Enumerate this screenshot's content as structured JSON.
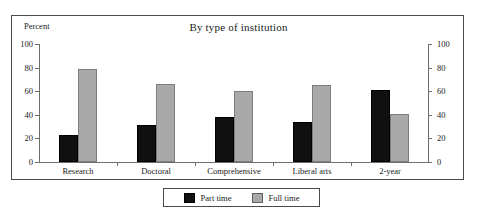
{
  "chart_data": {
    "type": "bar",
    "title": "By type of institution",
    "xlabel": "",
    "ylabel": "Percent",
    "ylim": [
      0,
      100
    ],
    "yticks": [
      0,
      20,
      40,
      60,
      80,
      100
    ],
    "ytick_labels": [
      "0",
      "20",
      "40",
      "60",
      "80",
      "100"
    ],
    "grid": false,
    "dual_axis": true,
    "right_axis_labels": [
      "0",
      "20",
      "40",
      "60",
      "80",
      "100"
    ],
    "legend_position": "bottom-outside",
    "categories": [
      "Research",
      "Doctoral",
      "Comprehensive",
      "Liberal arts",
      "2-year"
    ],
    "series": [
      {
        "name": "Part time",
        "color": "#101010",
        "values": [
          23,
          31,
          38,
          34,
          61
        ]
      },
      {
        "name": "Full time",
        "color": "#a9a9a9",
        "values": [
          79,
          66,
          60,
          65,
          41
        ]
      }
    ]
  },
  "legend": {
    "items": [
      {
        "label": "Part time"
      },
      {
        "label": "Full time"
      }
    ]
  },
  "colors": {
    "part_time": "#101010",
    "full_time": "#a9a9a9",
    "axis": "#6e6e6e",
    "frame": "#4a4a4a",
    "background": "#ffffff"
  }
}
